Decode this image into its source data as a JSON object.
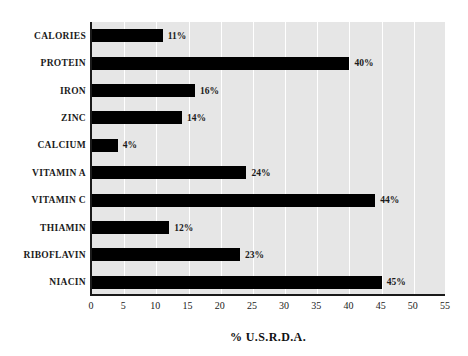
{
  "chart_data": {
    "type": "bar",
    "orientation": "horizontal",
    "title": "",
    "xlabel": "% U.S.R.D.A.",
    "ylabel": "",
    "xlim": [
      0,
      55
    ],
    "xticks": [
      0,
      5,
      10,
      15,
      20,
      25,
      30,
      35,
      40,
      45,
      50,
      55
    ],
    "xtick_labels": [
      "0",
      "5",
      "10",
      "15",
      "20",
      "25",
      "30",
      "35",
      "40",
      "45",
      "50",
      "55"
    ],
    "grid": true,
    "grid_axis": "x",
    "legend": false,
    "categories": [
      "CALORIES",
      "PROTEIN",
      "IRON",
      "ZINC",
      "CALCIUM",
      "VITAMIN A",
      "VITAMIN C",
      "THIAMIN",
      "RIBOFLAVIN",
      "NIACIN"
    ],
    "values": [
      11,
      40,
      16,
      14,
      4,
      24,
      44,
      12,
      23,
      45
    ],
    "data_labels": [
      "11%",
      "40%",
      "16%",
      "14%",
      "4%",
      "24%",
      "44%",
      "12%",
      "23%",
      "45%"
    ],
    "colors": {
      "bar": "#000000",
      "plot_background": "#e6e6e6",
      "grid": "#ffffff",
      "axis": "#1a1a1a",
      "text": "#1a1a1a",
      "page_background": "#ffffff"
    }
  }
}
